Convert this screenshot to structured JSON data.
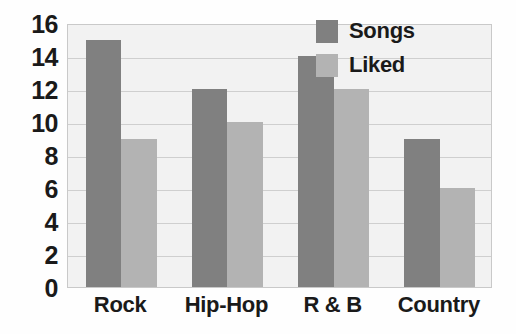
{
  "chart_data": {
    "type": "bar",
    "title": "",
    "xlabel": "",
    "ylabel": "",
    "categories": [
      "Rock",
      "Hip-Hop",
      "R & B",
      "Country"
    ],
    "series": [
      {
        "name": "Songs",
        "color": "#808080",
        "values": [
          15,
          12,
          14,
          9
        ]
      },
      {
        "name": "Liked",
        "color": "#b3b3b3",
        "values": [
          9,
          10,
          12,
          6
        ]
      }
    ],
    "ylim": [
      0,
      16
    ],
    "ytick_step": 2,
    "yticks": [
      16,
      14,
      12,
      10,
      8,
      6,
      4,
      2,
      0
    ],
    "grid": true,
    "legend_position": "top-right",
    "plot_background": "#f2f2f2",
    "gridline_color": "#cfcfcf",
    "axis_text_color": "#1a1a1a"
  },
  "legend": {
    "entries": [
      {
        "label": "Songs",
        "swatch": "legend-swatch-songs"
      },
      {
        "label": "Liked",
        "swatch": "legend-swatch-liked"
      }
    ]
  }
}
